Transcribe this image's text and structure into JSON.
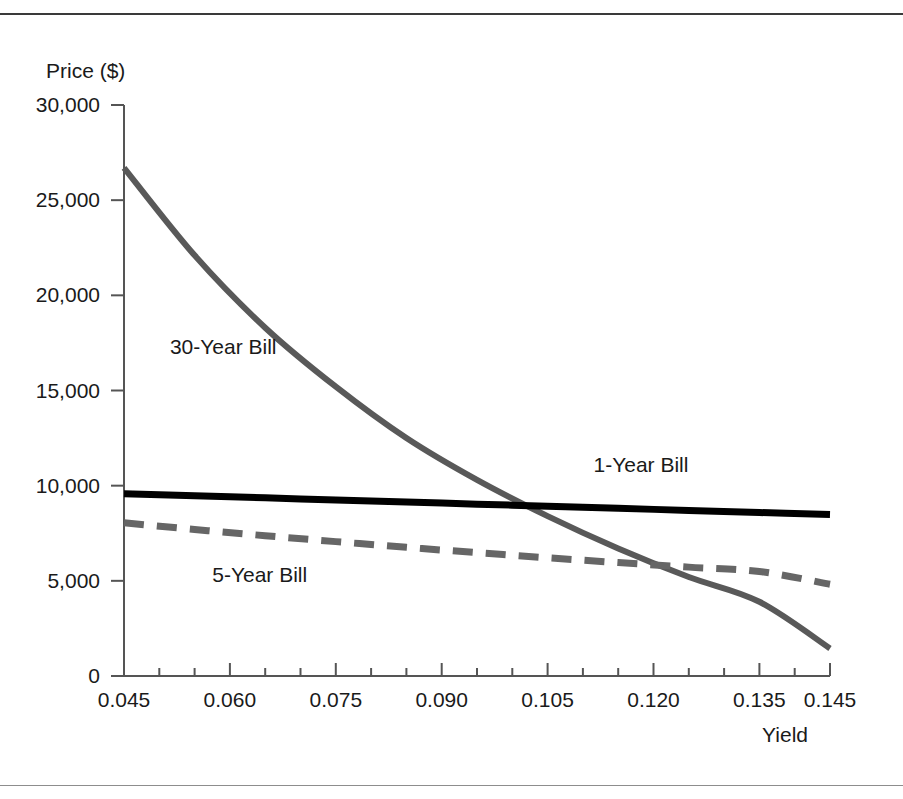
{
  "figure": {
    "has_top_rule": true,
    "has_bottom_rule": true,
    "background": "#ffffff"
  },
  "chart_data": {
    "type": "line",
    "title": "",
    "xlabel": "Yield",
    "ylabel": "Price ($)",
    "xlim": [
      0.045,
      0.145
    ],
    "ylim": [
      0,
      30000
    ],
    "grid": false,
    "legend": "inline-annotations",
    "x_ticks": [
      "0.045",
      "0.060",
      "0.075",
      "0.090",
      "0.105",
      "0.120",
      "0.135",
      "0.145"
    ],
    "x_tick_values": [
      0.045,
      0.06,
      0.075,
      0.09,
      0.105,
      0.12,
      0.135,
      0.145
    ],
    "x_minor_tick_values": [
      0.05,
      0.055,
      0.065,
      0.07,
      0.08,
      0.085,
      0.095,
      0.1,
      0.11,
      0.115,
      0.125,
      0.13,
      0.14
    ],
    "y_ticks": [
      "0",
      "5,000",
      "10,000",
      "15,000",
      "20,000",
      "25,000",
      "30,000"
    ],
    "y_tick_values": [
      0,
      5000,
      10000,
      15000,
      20000,
      25000,
      30000
    ],
    "x": [
      0.045,
      0.055,
      0.065,
      0.075,
      0.085,
      0.095,
      0.105,
      0.115,
      0.125,
      0.135,
      0.145
    ],
    "series": [
      {
        "name": "30-Year Bill",
        "label": "30-Year Bill",
        "color": "#595959",
        "style": "solid",
        "width": 6,
        "values": [
          26700,
          22100,
          18300,
          15200,
          12500,
          10300,
          8400,
          6700,
          5200,
          3900,
          1450
        ],
        "annotation": {
          "text": "30-Year Bill",
          "x": 0.0515,
          "y": 16900
        }
      },
      {
        "name": "1-Year Bill",
        "label": "1-Year Bill",
        "color": "#000000",
        "style": "solid",
        "width": 7,
        "values": [
          9580,
          9470,
          9360,
          9250,
          9140,
          9030,
          8920,
          8810,
          8700,
          8590,
          8480
        ],
        "annotation": {
          "text": "1-Year Bill",
          "x": 0.1115,
          "y": 10700
        }
      },
      {
        "name": "5-Year Bill",
        "label": "5-Year Bill",
        "color": "#666666",
        "style": "dashed",
        "width": 7,
        "values": [
          8050,
          7700,
          7370,
          7060,
          6760,
          6480,
          6210,
          5960,
          5720,
          5490,
          4820
        ],
        "annotation": {
          "text": "5-Year Bill",
          "x": 0.0575,
          "y": 4950
        }
      }
    ]
  }
}
